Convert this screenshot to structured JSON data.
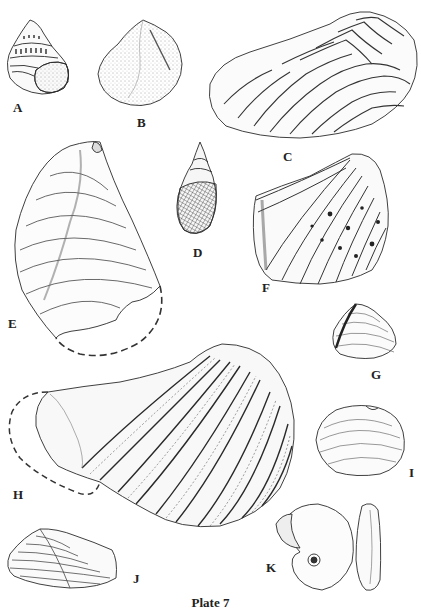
{
  "plate": {
    "caption": "Plate 7",
    "ink_color": "#2a2a2a",
    "background": "#ffffff",
    "figures": [
      {
        "id": "A",
        "label": "A",
        "kind": "gastropod (turbinate shell with aperture)"
      },
      {
        "id": "B",
        "label": "B",
        "kind": "bivalve (rounded, stippled)"
      },
      {
        "id": "C",
        "label": "C",
        "kind": "bivalve (elongate, chevron ribbing)"
      },
      {
        "id": "D",
        "label": "D",
        "kind": "gastropod (high-spired, reticulate)"
      },
      {
        "id": "E",
        "label": "E",
        "kind": "bivalve (concentric growth lines, reconstructed margin dashed)"
      },
      {
        "id": "F",
        "label": "F",
        "kind": "bivalve (radial ribs with nodes)"
      },
      {
        "id": "G",
        "label": "G",
        "kind": "bivalve (small, triangular)"
      },
      {
        "id": "H",
        "label": "H",
        "kind": "bivalve (large, radial nodose ribs, reconstructed margin dashed)"
      },
      {
        "id": "I",
        "label": "I",
        "kind": "bivalve (oval, concentric lines)"
      },
      {
        "id": "J",
        "label": "J",
        "kind": "bivalve (elongate, concentric lines)"
      },
      {
        "id": "K",
        "label": "K",
        "kind": "ammonoid (side and edge views)"
      }
    ]
  }
}
